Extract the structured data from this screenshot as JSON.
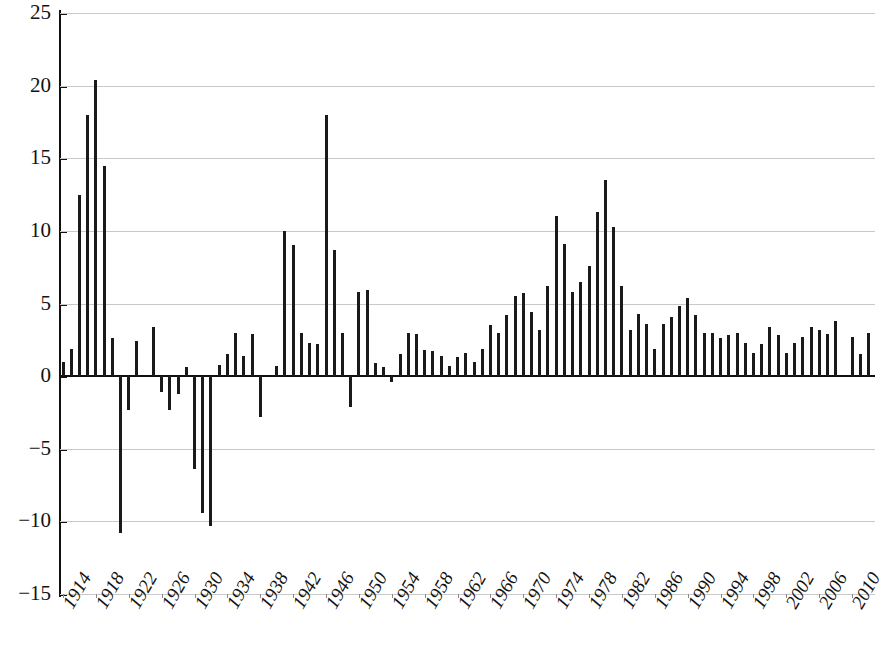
{
  "chart_data": {
    "type": "bar",
    "title": "",
    "subtitle": "",
    "xlabel": "",
    "ylabel": "",
    "ylim": [
      -15,
      25
    ],
    "xlim": [
      1914,
      2012
    ],
    "grid": true,
    "gridlines_y": [
      25,
      20,
      15,
      10,
      5,
      0,
      -5,
      -10,
      -15
    ],
    "ytick_labels": [
      "25",
      "20",
      "15",
      "10",
      "5",
      "0",
      "−5",
      "−10",
      "−15"
    ],
    "ytick_values": [
      25,
      20,
      15,
      10,
      5,
      0,
      -5,
      -10,
      -15
    ],
    "xtick_labels": [
      "1914",
      "1918",
      "1922",
      "1926",
      "1930",
      "1934",
      "1938",
      "1942",
      "1946",
      "1950",
      "1954",
      "1958",
      "1962",
      "1966",
      "1970",
      "1974",
      "1978",
      "1982",
      "1986",
      "1990",
      "1994",
      "1998",
      "2002",
      "2006",
      "2010"
    ],
    "xtick_values": [
      1914,
      1918,
      1922,
      1926,
      1930,
      1934,
      1938,
      1942,
      1946,
      1950,
      1954,
      1958,
      1962,
      1966,
      1970,
      1974,
      1978,
      1982,
      1986,
      1990,
      1994,
      1998,
      2002,
      2006,
      2010
    ],
    "legend": [],
    "legend_position": "none",
    "bar_color": "#1a1a1a",
    "categories": [
      1914,
      1915,
      1916,
      1917,
      1918,
      1919,
      1920,
      1921,
      1922,
      1923,
      1924,
      1925,
      1926,
      1927,
      1928,
      1929,
      1930,
      1931,
      1932,
      1933,
      1934,
      1935,
      1936,
      1937,
      1938,
      1939,
      1940,
      1941,
      1942,
      1943,
      1944,
      1945,
      1946,
      1947,
      1948,
      1949,
      1950,
      1951,
      1952,
      1953,
      1954,
      1955,
      1956,
      1957,
      1958,
      1959,
      1960,
      1961,
      1962,
      1963,
      1964,
      1965,
      1966,
      1967,
      1968,
      1969,
      1970,
      1971,
      1972,
      1973,
      1974,
      1975,
      1976,
      1977,
      1978,
      1979,
      1980,
      1981,
      1982,
      1983,
      1984,
      1985,
      1986,
      1987,
      1988,
      1989,
      1990,
      1991,
      1992,
      1993,
      1994,
      1995,
      1996,
      1997,
      1998,
      1999,
      2000,
      2001,
      2002,
      2003,
      2004,
      2005,
      2006,
      2007,
      2008,
      2009,
      2010,
      2011,
      2012
    ],
    "values": [
      1.0,
      1.9,
      12.5,
      18.0,
      20.4,
      14.5,
      2.6,
      -10.8,
      -2.3,
      2.4,
      0.0,
      3.4,
      -1.1,
      -2.3,
      -1.2,
      0.6,
      -6.4,
      -9.4,
      -10.3,
      0.8,
      1.5,
      3.0,
      1.4,
      2.9,
      -2.8,
      0.0,
      0.7,
      10.0,
      9.0,
      3.0,
      2.3,
      2.2,
      18.0,
      8.7,
      3.0,
      -2.1,
      5.8,
      5.9,
      0.9,
      0.6,
      -0.4,
      1.5,
      3.0,
      2.9,
      1.8,
      1.7,
      1.4,
      0.7,
      1.3,
      1.6,
      1.0,
      1.9,
      3.5,
      3.0,
      4.2,
      5.5,
      5.7,
      4.4,
      3.2,
      6.2,
      11.0,
      9.1,
      5.8,
      6.5,
      7.6,
      11.3,
      13.5,
      10.3,
      6.2,
      3.2,
      4.3,
      3.6,
      1.9,
      3.6,
      4.1,
      4.8,
      5.4,
      4.2,
      3.0,
      3.0,
      2.6,
      2.8,
      3.0,
      2.3,
      1.6,
      2.2,
      3.4,
      2.8,
      1.6,
      2.3,
      2.7,
      3.4,
      3.2,
      2.9,
      3.8,
      0.0,
      2.7,
      1.5,
      3.0
    ]
  }
}
